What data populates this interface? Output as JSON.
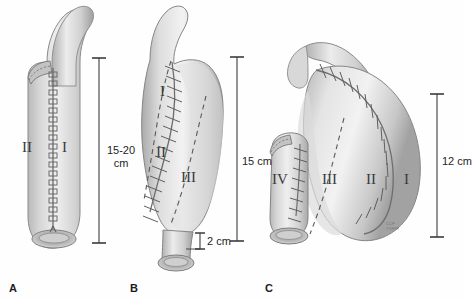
{
  "figure": {
    "background_color": "#fefefe",
    "ink_color": "#3a3a3a",
    "signature": {
      "line1": "CCF",
      "line2": "©1999"
    }
  },
  "panels": [
    {
      "id": "A",
      "letter": "A",
      "numerals": [
        {
          "label": "II",
          "x": 22,
          "y": 140
        },
        {
          "label": "I",
          "x": 60,
          "y": 140
        }
      ],
      "dimension": {
        "name": "length-dimension-a",
        "value_line1": "15-20",
        "value_line2": "cm",
        "bar_x": 99,
        "bar_top": 58,
        "bar_bottom": 243
      }
    },
    {
      "id": "B",
      "letter": "B",
      "numerals": [
        {
          "label": "I",
          "x": 160,
          "y": 84
        },
        {
          "label": "II",
          "x": 156,
          "y": 145
        },
        {
          "label": "III",
          "x": 181,
          "y": 170
        }
      ],
      "dimension": {
        "name": "length-dimension-b",
        "value_line1": "15 cm",
        "value_line2": "",
        "bar_x": 237,
        "bar_top": 57,
        "bar_bottom": 241
      },
      "dimension_small": {
        "name": "length-dimension-b-distal",
        "value": "2 cm",
        "bar_x": 200,
        "bar_top": 233,
        "bar_bottom": 249
      }
    },
    {
      "id": "C",
      "letter": "C",
      "numerals": [
        {
          "label": "IV",
          "x": 272,
          "y": 172
        },
        {
          "label": "III",
          "x": 322,
          "y": 172
        },
        {
          "label": "II",
          "x": 366,
          "y": 172
        },
        {
          "label": "I",
          "x": 404,
          "y": 172
        }
      ],
      "dimension": {
        "name": "length-dimension-c",
        "value_line1": "12 cm",
        "value_line2": "",
        "bar_x": 437,
        "bar_top": 94,
        "bar_bottom": 237
      }
    }
  ],
  "panel_letters": [
    {
      "label": "A",
      "x": 9,
      "y": 282
    },
    {
      "label": "B",
      "x": 130,
      "y": 282
    },
    {
      "label": "C",
      "x": 265,
      "y": 282
    }
  ]
}
